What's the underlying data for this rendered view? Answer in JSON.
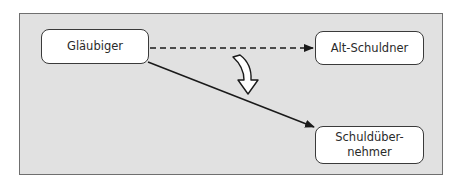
{
  "diagram": {
    "nodes": {
      "creditor": {
        "label": "Gläubiger"
      },
      "old_debtor": {
        "label": "Alt-Schuldner"
      },
      "new_debtor": {
        "line1": "Schuldüber-",
        "line2": "nehmer",
        "label": "Schuldübernehmer"
      }
    },
    "edges": [
      {
        "from": "Gläubiger",
        "to": "Alt-Schuldner",
        "style": "dashed"
      },
      {
        "from": "Gläubiger",
        "to": "Schuldübernehmer",
        "style": "solid"
      }
    ],
    "transition_arrow": {
      "style": "hollow-curved",
      "meaning": "shift of debt relationship"
    },
    "colors": {
      "panel_bg": "#e1e1e1",
      "panel_border": "#6f6f6f",
      "node_bg": "#ffffff",
      "line": "#1a1a1a"
    }
  }
}
